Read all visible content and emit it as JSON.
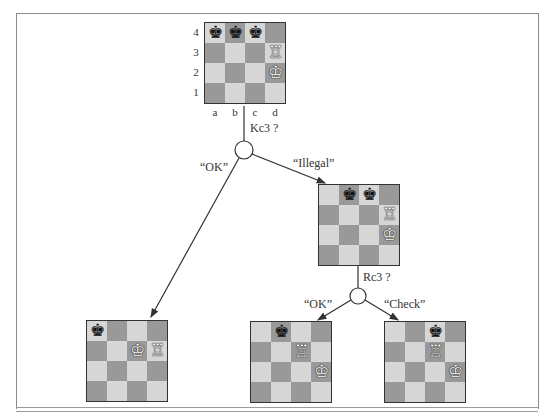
{
  "root": {
    "ranks": [
      "4",
      "3",
      "2",
      "1"
    ],
    "files": [
      "a",
      "b",
      "c",
      "d"
    ],
    "pieces": [
      [
        "bk",
        "bk",
        "bk",
        ""
      ],
      [
        "",
        "",
        "",
        "wr"
      ],
      [
        "",
        "",
        "",
        "wk"
      ],
      [
        "",
        "",
        "",
        ""
      ]
    ]
  },
  "moves": {
    "first": "Kc3 ?",
    "second": "Rc3 ?"
  },
  "edges": {
    "ok1": "“OK”",
    "illegal": "“Illegal”",
    "ok2": "“OK”",
    "check": "“Check”"
  },
  "boards": {
    "middle": [
      [
        "",
        "bk",
        "bk",
        ""
      ],
      [
        "",
        "",
        "",
        "wr"
      ],
      [
        "",
        "",
        "",
        "wk"
      ],
      [
        "",
        "",
        "",
        ""
      ]
    ],
    "bottom_left": [
      [
        "bk",
        "",
        "",
        ""
      ],
      [
        "",
        "",
        "wk",
        "wr"
      ],
      [
        "",
        "",
        "",
        ""
      ],
      [
        "",
        "",
        "",
        ""
      ]
    ],
    "bottom_middle": [
      [
        "",
        "bk",
        "",
        ""
      ],
      [
        "",
        "",
        "wr",
        ""
      ],
      [
        "",
        "",
        "",
        "wk"
      ],
      [
        "",
        "",
        "",
        ""
      ]
    ],
    "bottom_right": [
      [
        "",
        "",
        "bk",
        ""
      ],
      [
        "",
        "",
        "wr",
        ""
      ],
      [
        "",
        "",
        "",
        "wk"
      ],
      [
        "",
        "",
        "",
        ""
      ]
    ]
  },
  "glyphs": {
    "bk": "♚",
    "wk": "♔",
    "wr": "♖"
  },
  "colors": {
    "light_square": "#d6d6d6",
    "dark_square": "#999999",
    "line": "#333333"
  }
}
